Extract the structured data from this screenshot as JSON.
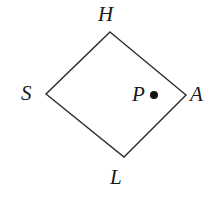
{
  "figure": {
    "type": "geometry-diagram",
    "background_color": "#ffffff",
    "stroke_color": "#2b2b2b",
    "stroke_width": 1.4,
    "shape": {
      "name": "quadrilateral",
      "closed": true,
      "vertices": [
        {
          "label": "H",
          "x": 110,
          "y": 32
        },
        {
          "label": "A",
          "x": 186,
          "y": 95
        },
        {
          "label": "L",
          "x": 124,
          "y": 157
        },
        {
          "label": "S",
          "x": 46,
          "y": 94
        }
      ]
    },
    "points": [
      {
        "label": "P",
        "x": 154,
        "y": 95,
        "radius": 4,
        "fill": "#111111"
      }
    ],
    "labels": {
      "H": "H",
      "S": "S",
      "A": "A",
      "L": "L",
      "P": "P"
    }
  }
}
